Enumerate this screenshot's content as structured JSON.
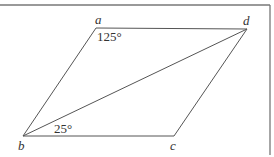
{
  "figure": {
    "type": "parallelogram",
    "vertices": {
      "a": {
        "label": "a"
      },
      "b": {
        "label": "b"
      },
      "c": {
        "label": "c"
      },
      "d": {
        "label": "d"
      }
    },
    "angles": {
      "at_a": "125°",
      "at_b_dbc": "25°"
    },
    "colors": {
      "stroke": "#555555",
      "border": "#777777",
      "text": "#333333"
    }
  }
}
